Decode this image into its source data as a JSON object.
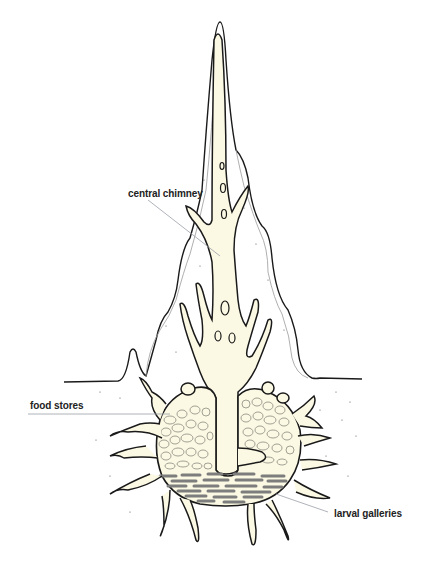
{
  "diagram": {
    "labels": [
      {
        "id": "central-chimney",
        "text": "central chimney"
      },
      {
        "id": "food-stores",
        "text": "food stores"
      },
      {
        "id": "larval-galleries",
        "text": "larval galleries"
      }
    ],
    "colors": {
      "fill": "#fbf8e3",
      "outline": "#1a1a1a",
      "leader_line": "#9aa0a8",
      "galleries": "#7d7d7d",
      "food_cells": "#8a8a80"
    }
  }
}
